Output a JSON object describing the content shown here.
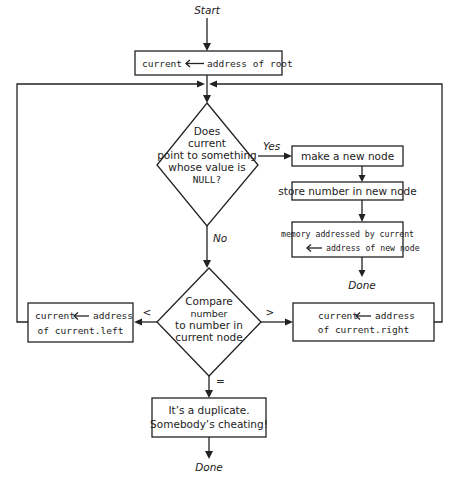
{
  "diagram": {
    "start_label": "Start",
    "init_box": {
      "left": "current",
      "right": "address of root"
    },
    "decision_null": {
      "lines": [
        "Does",
        "current",
        "point to something",
        "whose value is",
        "NULL?"
      ],
      "yes_label": "Yes",
      "no_label": "No"
    },
    "insert_path": {
      "make_node": "make a new node",
      "store_number": "store number in new node",
      "memory_line1": "memory addressed by current",
      "memory_line2": "address of new node",
      "done_label": "Done"
    },
    "decision_compare": {
      "lines": [
        "Compare",
        "number",
        "to number in",
        "current node"
      ],
      "less_label": "<",
      "greater_label": ">",
      "equal_label": "="
    },
    "left_box": {
      "line1_left": "current",
      "line1_right": "address",
      "line2": "of current.left"
    },
    "right_box": {
      "line1_left": "current",
      "line1_right": "address",
      "line2": "of current.right"
    },
    "duplicate_box": {
      "line1": "It’s a duplicate.",
      "line2": "Somebody’s cheating!"
    },
    "final_done_label": "Done",
    "colors": {
      "stroke": "#222222",
      "background": "#ffffff"
    }
  }
}
